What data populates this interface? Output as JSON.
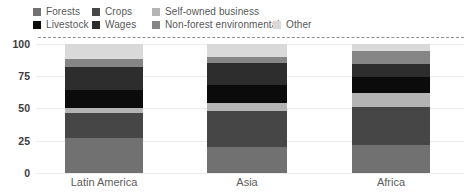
{
  "chart_data": {
    "type": "bar",
    "stacked": true,
    "title": "",
    "xlabel": "",
    "ylabel": "",
    "categories": [
      "Latin America",
      "Asia",
      "Africa"
    ],
    "series": [
      {
        "name": "Forests",
        "color": "#717171",
        "values": [
          27,
          20,
          22
        ]
      },
      {
        "name": "Crops",
        "color": "#464646",
        "values": [
          19,
          28,
          29
        ]
      },
      {
        "name": "Self-owned business",
        "color": "#b4b4b4",
        "values": [
          4,
          6,
          11
        ]
      },
      {
        "name": "Livestock",
        "color": "#0b0b0b",
        "values": [
          14,
          14,
          12
        ]
      },
      {
        "name": "Wages",
        "color": "#2d2d2d",
        "values": [
          18,
          17,
          10
        ]
      },
      {
        "name": "Non-forest environmental",
        "color": "#868686",
        "values": [
          6,
          5,
          10
        ]
      },
      {
        "name": "Other",
        "color": "#d9d9d9",
        "values": [
          12,
          10,
          6
        ]
      }
    ],
    "ylim": [
      0,
      100
    ],
    "yticks": [
      0,
      25,
      50,
      75,
      100
    ],
    "grid": "horizontal",
    "legend_position": "top-left",
    "legend_rows": [
      [
        "Forests",
        "Crops",
        "Self-owned business"
      ],
      [
        "Livestock",
        "Wages",
        "Non-forest environmental",
        "Other"
      ]
    ]
  }
}
